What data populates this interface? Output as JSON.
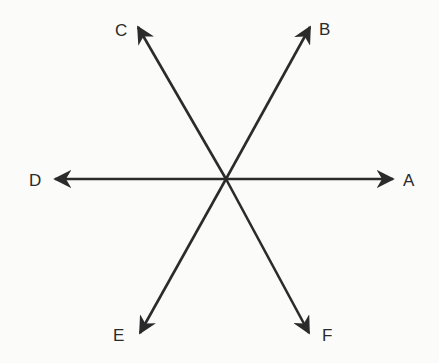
{
  "diagram": {
    "type": "six directional arrows radiating from a common center",
    "center": [
      226,
      179
    ],
    "stroke_color": "#2b2b2b",
    "arrows": [
      {
        "label": "A",
        "tip": [
          393,
          179
        ],
        "label_pos": [
          403,
          186
        ]
      },
      {
        "label": "B",
        "tip": [
          310,
          27
        ],
        "label_pos": [
          319,
          35
        ]
      },
      {
        "label": "C",
        "tip": [
          138,
          27
        ],
        "label_pos": [
          115,
          36
        ]
      },
      {
        "label": "D",
        "tip": [
          55,
          179
        ],
        "label_pos": [
          29,
          186
        ]
      },
      {
        "label": "E",
        "tip": [
          140,
          333
        ],
        "label_pos": [
          113,
          341
        ]
      },
      {
        "label": "F",
        "tip": [
          309,
          333
        ],
        "label_pos": [
          322,
          341
        ]
      }
    ]
  }
}
